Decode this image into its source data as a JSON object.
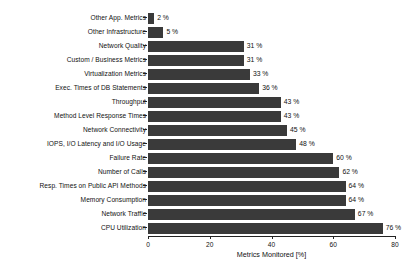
{
  "chart_data": {
    "type": "bar",
    "orientation": "horizontal",
    "title": "",
    "xlabel": "Metrics Monitored [%]",
    "ylabel": "",
    "xlim": [
      0,
      80
    ],
    "xticks": [
      0,
      20,
      40,
      60,
      80
    ],
    "xtick_labels": [
      "0",
      "20",
      "40",
      "60",
      "80"
    ],
    "grid": false,
    "legend": false,
    "value_label_suffix": " %",
    "bar_color": "#3a3a3a",
    "background_color": "#ffffff",
    "categories": [
      "Other App. Metrics",
      "Other Infrastructure",
      "Network Quality",
      "Custom / Business Metrics",
      "Virtualization Metrics",
      "Exec. Times of DB Statements",
      "Throughput",
      "Method Level Response Times",
      "Network Connectivity",
      "IOPS, I/O Latency and I/O Usage",
      "Failure Rate",
      "Number of Calls",
      "Resp. Times on Public API Methods",
      "Memory Consumption",
      "Network Traffic",
      "CPU Utilization"
    ],
    "values": [
      2,
      5,
      31,
      31,
      33,
      36,
      43,
      43,
      45,
      48,
      60,
      62,
      64,
      64,
      67,
      76
    ],
    "value_labels": [
      "2 %",
      "5 %",
      "31 %",
      "31 %",
      "33 %",
      "36 %",
      "43 %",
      "43 %",
      "45 %",
      "48 %",
      "60 %",
      "62 %",
      "64 %",
      "64 %",
      "67 %",
      "76 %"
    ]
  }
}
